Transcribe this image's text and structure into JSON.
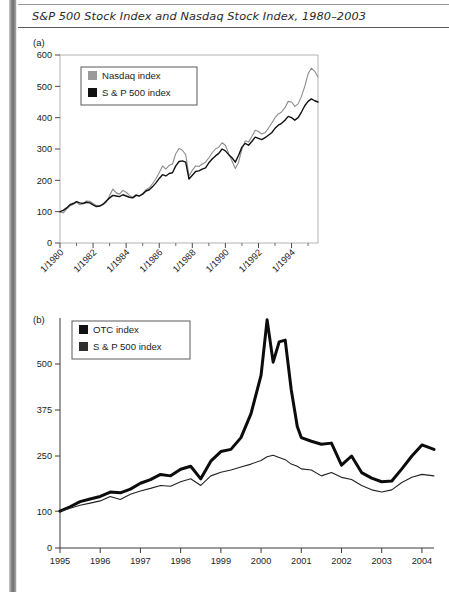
{
  "figure": {
    "title": "S&P 500 Stock Index and Nasdaq Stock Index, 1980–2003"
  },
  "panels": {
    "a": {
      "letter": "(a)",
      "legend": [
        {
          "label": "Nasdaq index",
          "swatch": "#9a9a9a",
          "name": "legend-swatch-nasdaq"
        },
        {
          "label": "S & P 500 index",
          "swatch": "#111111",
          "name": "legend-swatch-sp500"
        }
      ],
      "yticks": [
        "0",
        "100",
        "200",
        "300",
        "400",
        "500",
        "600"
      ],
      "xticks": [
        "1/1980",
        "1/1982",
        "1/1984",
        "1/1986",
        "1/1988",
        "1/1990",
        "1/1992",
        "1/1994"
      ]
    },
    "b": {
      "letter": "(b)",
      "legend": [
        {
          "label": "OTC index",
          "swatch": "#111111",
          "name": "legend-swatch-otc"
        },
        {
          "label": "S & P 500 index",
          "swatch": "#2e2e2e",
          "name": "legend-swatch-sp500"
        }
      ],
      "yticks": [
        "0",
        "100",
        "250",
        "375",
        "500"
      ],
      "xticks": [
        "1995",
        "1996",
        "1997",
        "1998",
        "1999",
        "2000",
        "2001",
        "2002",
        "2003",
        "2004"
      ]
    }
  },
  "chart_data": [
    {
      "type": "line",
      "panel": "(a)",
      "title": "S&P 500 Stock Index and Nasdaq Stock Index, 1980–2003",
      "xlabel": "",
      "ylabel": "",
      "ylim": [
        0,
        600
      ],
      "ytick_values": [
        0,
        100,
        200,
        300,
        400,
        500,
        600
      ],
      "xtick_labels": [
        "1/1980",
        "1/1982",
        "1/1984",
        "1/1986",
        "1/1988",
        "1/1990",
        "1/1992",
        "1/1994"
      ],
      "xtick_values": [
        1980,
        1982,
        1984,
        1986,
        1988,
        1990,
        1992,
        1994
      ],
      "xlim": [
        1980,
        1995.6
      ],
      "grid": false,
      "legend_position": "upper-left-inset",
      "x": [
        1980.0,
        1980.2,
        1980.4,
        1980.6,
        1980.8,
        1981.0,
        1981.2,
        1981.4,
        1981.6,
        1981.8,
        1982.0,
        1982.2,
        1982.4,
        1982.6,
        1982.8,
        1983.0,
        1983.2,
        1983.4,
        1983.6,
        1983.8,
        1984.0,
        1984.2,
        1984.4,
        1984.6,
        1984.8,
        1985.0,
        1985.2,
        1985.4,
        1985.6,
        1985.8,
        1986.0,
        1986.2,
        1986.4,
        1986.6,
        1986.8,
        1987.0,
        1987.2,
        1987.4,
        1987.6,
        1987.8,
        1988.0,
        1988.2,
        1988.4,
        1988.6,
        1988.8,
        1989.0,
        1989.2,
        1989.4,
        1989.6,
        1989.8,
        1990.0,
        1990.2,
        1990.4,
        1990.6,
        1990.8,
        1991.0,
        1991.2,
        1991.4,
        1991.6,
        1991.8,
        1992.0,
        1992.2,
        1992.4,
        1992.6,
        1992.8,
        1993.0,
        1993.2,
        1993.4,
        1993.6,
        1993.8,
        1994.0,
        1994.2,
        1994.4,
        1994.6,
        1994.8,
        1995.0,
        1995.2,
        1995.4,
        1995.6
      ],
      "series": [
        {
          "name": "Nasdaq index",
          "color": "#8c8c8c",
          "width": 1.1,
          "values": [
            100,
            96,
            108,
            118,
            124,
            130,
            122,
            126,
            134,
            133,
            126,
            120,
            118,
            122,
            130,
            152,
            172,
            160,
            156,
            168,
            162,
            152,
            146,
            155,
            150,
            158,
            170,
            176,
            190,
            205,
            224,
            246,
            236,
            248,
            252,
            285,
            302,
            296,
            282,
            214,
            232,
            246,
            244,
            252,
            258,
            272,
            288,
            300,
            306,
            320,
            312,
            286,
            262,
            238,
            258,
            300,
            326,
            322,
            340,
            360,
            356,
            348,
            352,
            366,
            382,
            400,
            412,
            418,
            432,
            452,
            450,
            436,
            444,
            468,
            500,
            540,
            558,
            548,
            530
          ]
        },
        {
          "name": "S & P 500 index",
          "color": "#111111",
          "width": 1.4,
          "values": [
            100,
            104,
            112,
            122,
            126,
            132,
            128,
            126,
            130,
            128,
            122,
            116,
            118,
            124,
            134,
            144,
            152,
            150,
            148,
            154,
            150,
            146,
            144,
            152,
            150,
            156,
            166,
            170,
            180,
            192,
            206,
            218,
            214,
            222,
            224,
            246,
            260,
            262,
            258,
            204,
            216,
            228,
            230,
            236,
            240,
            256,
            268,
            278,
            286,
            300,
            294,
            282,
            272,
            258,
            280,
            306,
            318,
            312,
            324,
            338,
            334,
            330,
            336,
            344,
            352,
            366,
            376,
            382,
            392,
            404,
            400,
            392,
            400,
            418,
            438,
            452,
            460,
            454,
            450
          ]
        }
      ]
    },
    {
      "type": "line",
      "panel": "(b)",
      "title": "",
      "xlabel": "",
      "ylabel": "",
      "ylim": [
        0,
        625
      ],
      "ytick_values": [
        0,
        100,
        250,
        375,
        500
      ],
      "xtick_labels": [
        "1995",
        "1996",
        "1997",
        "1998",
        "1999",
        "2000",
        "2001",
        "2002",
        "2003",
        "2004"
      ],
      "xtick_values": [
        1995,
        1996,
        1997,
        1998,
        1999,
        2000,
        2001,
        2002,
        2003,
        2004
      ],
      "xlim": [
        1995,
        2004.3
      ],
      "grid": false,
      "legend_position": "upper-left-inset",
      "x": [
        1995.0,
        1995.25,
        1995.5,
        1995.75,
        1996.0,
        1996.25,
        1996.5,
        1996.75,
        1997.0,
        1997.25,
        1997.5,
        1997.75,
        1998.0,
        1998.25,
        1998.5,
        1998.75,
        1999.0,
        1999.25,
        1999.5,
        1999.75,
        2000.0,
        2000.15,
        2000.3,
        2000.45,
        2000.6,
        2000.75,
        2000.9,
        2001.0,
        2001.25,
        2001.5,
        2001.75,
        2002.0,
        2002.25,
        2002.5,
        2002.75,
        2003.0,
        2003.25,
        2003.5,
        2003.75,
        2004.0,
        2004.3
      ],
      "series": [
        {
          "name": "OTC index",
          "color": "#0c0c0c",
          "width": 3.0,
          "values": [
            100,
            112,
            126,
            133,
            140,
            152,
            150,
            160,
            176,
            186,
            200,
            196,
            214,
            222,
            188,
            236,
            262,
            268,
            300,
            365,
            470,
            620,
            505,
            560,
            565,
            430,
            330,
            300,
            290,
            282,
            285,
            225,
            250,
            205,
            190,
            180,
            182,
            215,
            250,
            280,
            268
          ]
        },
        {
          "name": "S & P 500 index",
          "color": "#222222",
          "width": 1.1,
          "values": [
            100,
            108,
            116,
            122,
            128,
            140,
            132,
            146,
            155,
            162,
            170,
            168,
            180,
            188,
            170,
            196,
            206,
            212,
            220,
            228,
            238,
            248,
            252,
            246,
            240,
            228,
            222,
            215,
            212,
            196,
            205,
            192,
            186,
            170,
            158,
            152,
            158,
            178,
            192,
            200,
            196
          ]
        }
      ]
    }
  ]
}
